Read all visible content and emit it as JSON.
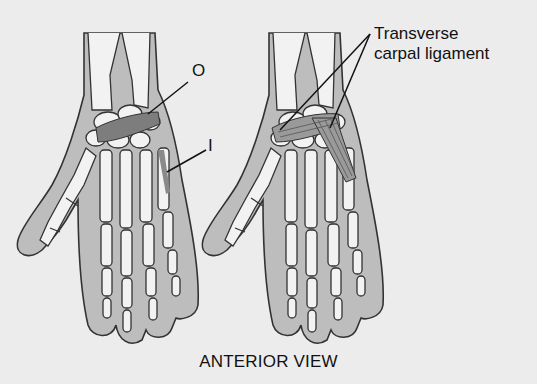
{
  "figure": {
    "caption": "ANTERIOR VIEW",
    "left_hand": {
      "labels": {
        "origin": "O",
        "insertion": "I"
      }
    },
    "right_hand": {
      "labels": {
        "ligament_line1": "Transverse",
        "ligament_line2": "carpal ligament"
      }
    },
    "colors": {
      "background": "#ececec",
      "skin": "#bdbdbd",
      "bone": "#f2f2f2",
      "outline": "#333333",
      "muscle_highlight": "#7d7d7d",
      "muscle_fibers": "#9a9a9a"
    }
  }
}
